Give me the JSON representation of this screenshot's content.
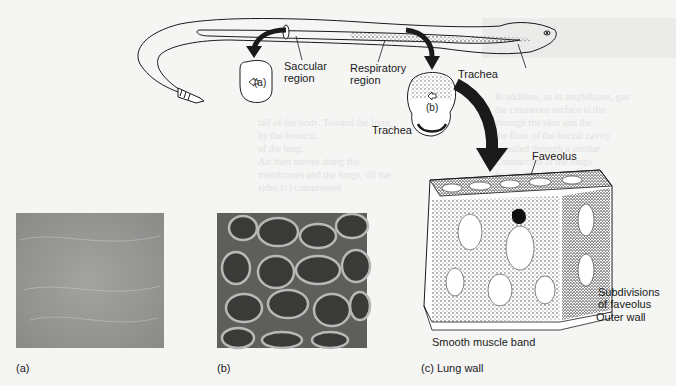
{
  "figure": {
    "top_labels": {
      "saccular_region": "Saccular\nregion",
      "saccular_line1": "Saccular",
      "saccular_line2": "region",
      "respiratory_line1": "Respiratory",
      "respiratory_line2": "region",
      "trachea_top": "Trachea",
      "trachea_cross": "Trachea",
      "section_a": "(a)",
      "section_b": "(b)"
    },
    "lung_wall_labels": {
      "faveolus": "Faveolus",
      "subdivisions_line1": "Subdivisions",
      "subdivisions_line2": "of faveolus",
      "outer_wall": "Outer wall",
      "smooth_muscle": "Smooth muscle band"
    },
    "captions": {
      "a": "(a)",
      "b": "(b)",
      "c": "(c) Lung wall"
    },
    "colors": {
      "background": "#f5f5f4",
      "ink": "#1a1a1a",
      "photo_a": "#9a9a98",
      "photo_b": "#6e6e6c"
    }
  }
}
